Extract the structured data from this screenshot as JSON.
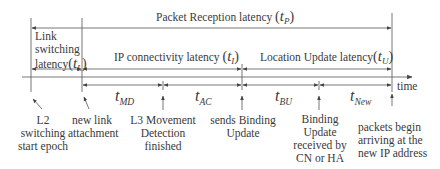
{
  "diagram": {
    "title_row": {
      "label": "Packet Reception latency",
      "symbol": "t",
      "subscript": "P"
    },
    "phases": [
      {
        "label_lines": [
          "Link",
          "switching",
          "latency"
        ],
        "symbol": "t",
        "subscript": "L"
      },
      {
        "label": "IP connectivity latency",
        "symbol": "t",
        "subscript": "I"
      },
      {
        "label": "Location Update latency",
        "symbol": "t",
        "subscript": "U"
      }
    ],
    "axis_label": "time",
    "segments": [
      {
        "symbol": "t",
        "subscript": "MD"
      },
      {
        "symbol": "t",
        "subscript": "AC"
      },
      {
        "symbol": "t",
        "subscript": "BU"
      },
      {
        "symbol": "t",
        "subscript": "New"
      }
    ],
    "events": [
      {
        "lines": [
          "L2",
          "switching",
          "start epoch"
        ]
      },
      {
        "lines": [
          "new link",
          "attachment"
        ]
      },
      {
        "lines": [
          "L3 Movement",
          "Detection",
          "finished"
        ]
      },
      {
        "lines": [
          "sends Binding",
          "Update"
        ]
      },
      {
        "lines": [
          "Binding",
          "Update",
          "received by",
          "CN or HA"
        ]
      },
      {
        "lines": [
          "packets begin",
          "arriving at the",
          "new IP address"
        ]
      }
    ],
    "colors": {
      "line": "#555555",
      "text": "#3a3a3a",
      "background": "#ffffff"
    }
  }
}
